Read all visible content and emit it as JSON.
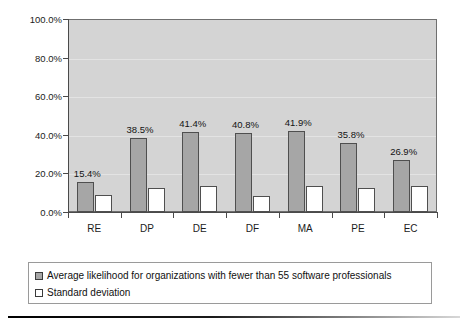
{
  "chart_data": {
    "type": "bar",
    "title": "",
    "xlabel": "",
    "ylabel": "",
    "categories": [
      "RE",
      "DP",
      "DE",
      "DF",
      "MA",
      "PE",
      "EC"
    ],
    "series": [
      {
        "name": "Average likelihood for organizations with fewer than 55 software professionals",
        "key": "average_likelihood",
        "color": "#a6a6a6",
        "values": [
          15.4,
          38.5,
          41.4,
          40.8,
          41.9,
          35.8,
          26.9
        ],
        "value_labels": [
          "15.4%",
          "38.5%",
          "41.4%",
          "40.8%",
          "41.9%",
          "35.8%",
          "26.9%"
        ]
      },
      {
        "name": "Standard deviation",
        "key": "standard_deviation",
        "color": "#ffffff",
        "values": [
          9.0,
          12.2,
          13.7,
          8.2,
          13.4,
          12.3,
          13.6
        ],
        "value_labels": [
          "",
          "",
          "",
          "",
          "",
          "",
          ""
        ]
      }
    ],
    "ylim": [
      0,
      100
    ],
    "y_ticks": [
      0,
      20,
      40,
      60,
      80,
      100
    ],
    "y_tick_labels": [
      "0.0%",
      "20.0%",
      "40.0%",
      "60.0%",
      "80.0%",
      "100.0%"
    ],
    "grid": true,
    "grid_axis": "y",
    "legend_position": "bottom",
    "plot_background": "#d4d4d4",
    "data_labels_shown_for": "average_likelihood"
  },
  "legend": {
    "items": [
      {
        "label": "Average likelihood for organizations with fewer than 55 software professionals",
        "swatch": "filled-gray"
      },
      {
        "label": "Standard deviation",
        "swatch": "outlined-white"
      }
    ]
  },
  "axes": {
    "y_tick_labels": [
      "100.0%",
      "80.0%",
      "60.0%",
      "40.0%",
      "20.0%",
      "0.0%"
    ],
    "x_tick_labels": [
      "RE",
      "DP",
      "DE",
      "DF",
      "MA",
      "PE",
      "EC"
    ]
  }
}
